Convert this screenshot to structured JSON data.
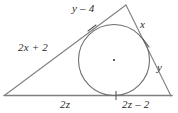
{
  "figure": {
    "type": "triangle-with-inscribed-circle",
    "stroke_color": "#808080",
    "label_color": "#2a2a2a",
    "background_color": "#ffffff",
    "vertices": {
      "left": {
        "x": 5,
        "y": 95
      },
      "apex": {
        "x": 126,
        "y": 5
      },
      "right": {
        "x": 171,
        "y": 96
      }
    },
    "incircle": {
      "center": {
        "x": 114,
        "y": 60
      },
      "radius": 36
    },
    "tick_marks": [
      {
        "name": "tick-left-tangent",
        "x": 92,
        "y": 28
      },
      {
        "name": "tick-right-tangent",
        "x": 146,
        "y": 43
      },
      {
        "name": "tick-base",
        "x": 116,
        "y": 95
      }
    ],
    "labels": [
      {
        "name": "label-top-left-segment",
        "text": "y – 4",
        "x": 72,
        "y": 3,
        "italic": true
      },
      {
        "name": "label-top-right-segment",
        "text": "x",
        "x": 140,
        "y": 19,
        "italic": true
      },
      {
        "name": "label-left-side",
        "text": "2x + 2",
        "x": 18,
        "y": 42,
        "italic": true
      },
      {
        "name": "label-right-side",
        "text": "y",
        "x": 157,
        "y": 62,
        "italic": true
      },
      {
        "name": "label-bottom-left-segment",
        "text": "2z",
        "x": 60,
        "y": 99,
        "italic": true
      },
      {
        "name": "label-bottom-right-segment",
        "text": "2z – 2",
        "x": 122,
        "y": 99,
        "italic": true
      }
    ]
  }
}
